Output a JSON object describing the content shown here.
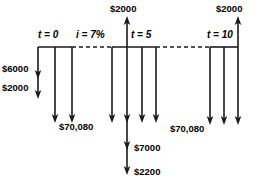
{
  "diagram": {
    "type": "cash-flow-diagram",
    "interest_rate_label": "i = 7%",
    "timeline_marks": [
      {
        "id": "t0",
        "label": "t = 0",
        "x": 38,
        "y": 30
      },
      {
        "id": "t5",
        "label": "t = 5",
        "x": 131,
        "y": 30
      },
      {
        "id": "t10",
        "label": "t = 10",
        "x": 207,
        "y": 30
      }
    ],
    "rate_mark": {
      "label": "i = 7%",
      "x": 76,
      "y": 30
    },
    "cash_flows": {
      "left_group": {
        "time_label": "t = 0",
        "outflow_labels": [
          "$6000",
          "$2000",
          "$70,080"
        ],
        "arrows_down": 3
      },
      "middle_group": {
        "time_label": "t = 5",
        "inflow_labels": [
          "$2000"
        ],
        "outflow_labels": [
          "$7000",
          "$2200"
        ],
        "arrows_down": 4,
        "arrows_up": 1
      },
      "right_group": {
        "time_label": "t = 10",
        "inflow_labels": [
          "$2000"
        ],
        "outflow_labels": [
          "$70,080"
        ],
        "arrows_down": 3,
        "arrows_up": 1
      }
    },
    "value_labels": [
      {
        "id": "left-6000",
        "text": "$6000",
        "x": 2,
        "y": 64,
        "align": "left"
      },
      {
        "id": "left-2000",
        "text": "$2000",
        "x": 2,
        "y": 83,
        "align": "left"
      },
      {
        "id": "left-70080",
        "text": "$70,080",
        "x": 59,
        "y": 122,
        "align": "left"
      },
      {
        "id": "mid-top-2000",
        "text": "$2000",
        "x": 110,
        "y": 4,
        "align": "left"
      },
      {
        "id": "mid-7000",
        "text": "$7000",
        "x": 134,
        "y": 143,
        "align": "left"
      },
      {
        "id": "mid-2200",
        "text": "$2200",
        "x": 134,
        "y": 167,
        "align": "left"
      },
      {
        "id": "right-70080",
        "text": "$70,080",
        "x": 170,
        "y": 124,
        "align": "left"
      },
      {
        "id": "right-top-2000",
        "text": "$2000",
        "x": 216,
        "y": 4,
        "align": "left"
      }
    ],
    "geometry": {
      "baseline_y": 47,
      "stroke_color": "#1a1a1a",
      "stroke_width": 1.6,
      "dash_pattern": "4,3",
      "baselines": [
        {
          "id": "left-baseline",
          "x1": 38,
          "x2": 72,
          "style": "solid"
        },
        {
          "id": "left-to-mid-dash",
          "x1": 72,
          "x2": 112,
          "style": "dashed"
        },
        {
          "id": "mid-baseline",
          "x1": 112,
          "x2": 156,
          "style": "solid"
        },
        {
          "id": "mid-to-right-dash",
          "x1": 156,
          "x2": 210,
          "style": "dashed"
        },
        {
          "id": "right-baseline",
          "x1": 210,
          "x2": 238,
          "style": "solid"
        }
      ],
      "down_arrows": [
        {
          "id": "left-short-stem",
          "x": 38,
          "y_end": 92,
          "heads": [
            70,
            90
          ]
        },
        {
          "id": "left-long-1",
          "x": 55,
          "y_end": 116,
          "heads": [
            114
          ]
        },
        {
          "id": "left-long-2",
          "x": 72,
          "y_end": 116,
          "heads": [
            114
          ]
        },
        {
          "id": "mid-1",
          "x": 112,
          "y_end": 116,
          "heads": [
            114
          ]
        },
        {
          "id": "mid-2",
          "x": 127,
          "y_end": 168,
          "heads": [
            114,
            141,
            166
          ]
        },
        {
          "id": "mid-3",
          "x": 142,
          "y_end": 116,
          "heads": [
            114
          ]
        },
        {
          "id": "mid-4",
          "x": 156,
          "y_end": 116,
          "heads": [
            114
          ]
        },
        {
          "id": "right-1",
          "x": 210,
          "y_end": 118,
          "heads": [
            116
          ]
        },
        {
          "id": "right-2",
          "x": 224,
          "y_end": 118,
          "heads": [
            116
          ]
        },
        {
          "id": "right-3",
          "x": 238,
          "y_end": 118,
          "heads": [
            116
          ]
        }
      ],
      "up_arrows": [
        {
          "id": "mid-inflow-2000",
          "x": 127,
          "y_top": 16
        },
        {
          "id": "right-inflow-2000",
          "x": 238,
          "y_top": 16
        }
      ]
    }
  }
}
